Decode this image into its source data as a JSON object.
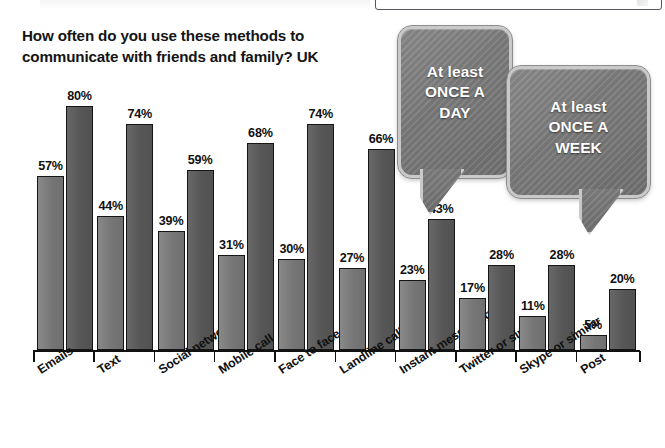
{
  "chart_data": {
    "type": "bar",
    "title": "How often do you use these methods to communicate with friends and family? UK",
    "xlabel": "",
    "ylabel": "",
    "ylim": [
      0,
      85
    ],
    "grid": false,
    "legend_position": "callout-bubbles-top-right",
    "value_suffix": "%",
    "categories": [
      "Emails",
      "Text",
      "Social network",
      "Mobile call",
      "Face to face",
      "Landline call",
      "Instant messaging",
      "Twitter or similar",
      "Skype or similar",
      "Post"
    ],
    "series": [
      {
        "name": "At least ONCE A WEEK",
        "color": "#7c7c7c",
        "values": [
          57,
          44,
          39,
          31,
          30,
          27,
          23,
          17,
          11,
          5
        ],
        "labels": [
          "57%",
          "44%",
          "39%",
          "31%",
          "30%",
          "27%",
          "23%",
          "17%",
          "11%",
          "5%"
        ]
      },
      {
        "name": "At least ONCE A DAY",
        "color": "#5b5b5b",
        "values": [
          80,
          74,
          59,
          68,
          74,
          66,
          43,
          28,
          28,
          20
        ],
        "labels": [
          "80%",
          "74%",
          "59%",
          "68%",
          "74%",
          "66%",
          "43%",
          "28%",
          "28%",
          "20%"
        ]
      }
    ]
  },
  "callouts": {
    "day": {
      "line1": "At least",
      "line2": "ONCE A",
      "line3": "DAY"
    },
    "week": {
      "line1": "At least",
      "line2": "ONCE A",
      "line3": "WEEK"
    }
  }
}
